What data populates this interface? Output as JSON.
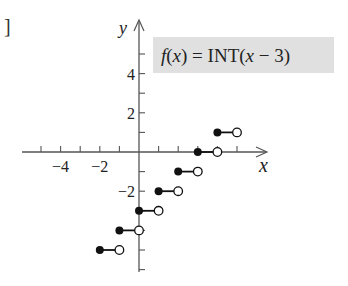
{
  "fragment": {
    "bracket": "]"
  },
  "chart_data": {
    "type": "step",
    "title": "f(x) = INT(x − 3)",
    "function_label": {
      "prefix": "f",
      "arg": "(x) = INT(",
      "var": "x",
      "rest": " − 3)"
    },
    "xlabel": "x",
    "ylabel": "y",
    "xlim": [
      -6,
      6
    ],
    "ylim": [
      -6,
      6
    ],
    "x_tick_labels": [
      {
        "value": -4,
        "label": "−4"
      },
      {
        "value": -2,
        "label": "−2"
      }
    ],
    "y_tick_labels": [
      {
        "value": 4,
        "label": "4"
      },
      {
        "value": 2,
        "label": "2"
      },
      {
        "value": -2,
        "label": "−2"
      }
    ],
    "x_ticks": [
      -5,
      -4,
      -3,
      -2,
      -1,
      1,
      2,
      3,
      4,
      5
    ],
    "y_ticks": [
      5,
      4,
      3,
      2,
      1,
      -1,
      -2,
      -3,
      -4,
      -5,
      -6
    ],
    "segments": [
      {
        "x_start": -2,
        "x_end": -1,
        "y": -5,
        "closed_start": true,
        "open_end": true
      },
      {
        "x_start": -1,
        "x_end": 0,
        "y": -4,
        "closed_start": true,
        "open_end": true
      },
      {
        "x_start": 0,
        "x_end": 1,
        "y": -3,
        "closed_start": true,
        "open_end": true
      },
      {
        "x_start": 1,
        "x_end": 2,
        "y": -2,
        "closed_start": true,
        "open_end": true
      },
      {
        "x_start": 2,
        "x_end": 3,
        "y": -1,
        "closed_start": true,
        "open_end": true
      },
      {
        "x_start": 3,
        "x_end": 4,
        "y": 0,
        "closed_start": true,
        "open_end": true
      },
      {
        "x_start": 4,
        "x_end": 5,
        "y": 1,
        "closed_start": true,
        "open_end": true
      }
    ],
    "grid": false,
    "label_box_color": "#e0e0e0",
    "axis_color": "#555555",
    "point_color": "#111111"
  }
}
